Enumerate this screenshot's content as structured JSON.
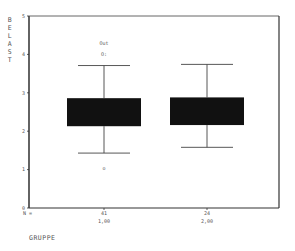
{
  "chart_data": {
    "type": "boxplot",
    "title": "",
    "xlabel": "GRUPPE",
    "ylabel": "BELAST",
    "ylim": [
      0,
      5
    ],
    "yticks": [
      0,
      1,
      2,
      3,
      4,
      5
    ],
    "grid": false,
    "legend": null,
    "n_label": "N =",
    "categories": [
      "1,00",
      "2,00"
    ],
    "counts": [
      "41",
      "24"
    ],
    "series": [
      {
        "name": "1,00",
        "whisker_low": 1.43,
        "q1": 2.13,
        "q3": 2.86,
        "whisker_high": 3.71,
        "outliers": [
          {
            "value": 4.29,
            "label": "Out"
          },
          {
            "value": 4.0,
            "label": "O:"
          },
          {
            "value": 1.04,
            "label": "o"
          }
        ]
      },
      {
        "name": "2,00",
        "whisker_low": 1.58,
        "q1": 2.16,
        "q3": 2.88,
        "whisker_high": 3.74,
        "outliers": []
      }
    ],
    "colors": {
      "box_fill": "#111111",
      "line": "#444444",
      "frame": "#333333"
    }
  }
}
